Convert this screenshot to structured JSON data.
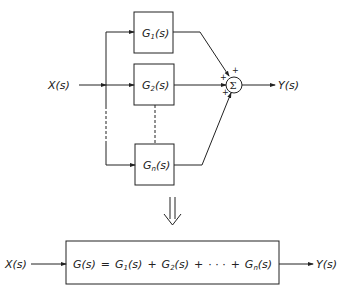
{
  "diagram": {
    "input_label": "X(s)",
    "output_label": "Y(s)",
    "blocks": [
      {
        "name": "G",
        "sub": "1",
        "tail": "(s)"
      },
      {
        "name": "G",
        "sub": "2",
        "tail": "(s)"
      },
      {
        "name": "G",
        "sub": "n",
        "tail": "(s)"
      }
    ],
    "summing_junction": {
      "symbol": "Σ",
      "signs": [
        "+",
        "+",
        "+"
      ]
    },
    "equivalent": {
      "input_label": "X(s)",
      "output_label": "Y(s)",
      "equation": "G(s) = G1(s) + G2(s) + · · · + Gn(s)",
      "parts": {
        "lhs": "G(s)",
        "eq": "=",
        "t1": "G",
        "t1sub": "1",
        "t1tail": "(s)",
        "plus": "+",
        "t2": "G",
        "t2sub": "2",
        "t2tail": "(s)",
        "dots": "· · ·",
        "tn": "G",
        "tnsub": "n",
        "tntail": "(s)"
      }
    },
    "reduction_arrow": "⇓"
  }
}
